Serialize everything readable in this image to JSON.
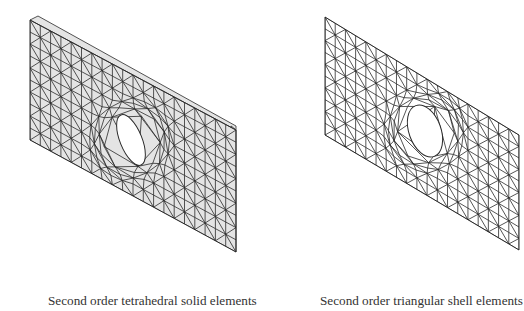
{
  "figures": [
    {
      "id": "left",
      "caption": "Second order tetrahedral solid elements",
      "type": "solid",
      "fill": "#e4e4e4",
      "line_color": "#2a2a2a",
      "outline": {
        "tl": [
          30,
          20
        ],
        "bl": [
          30,
          140
        ],
        "br": [
          236,
          252
        ],
        "tr": [
          236,
          130
        ]
      },
      "thickness": [
        8,
        -4
      ],
      "hole": {
        "cx": 131,
        "cy": 140,
        "rx": 11,
        "ry": 27,
        "rot": -22
      },
      "grid": {
        "cols": 20,
        "rows": 10
      }
    },
    {
      "id": "right",
      "caption": "Second order triangular shell elements",
      "type": "shell",
      "fill": "#ffffff",
      "line_color": "#2a2a2a",
      "outline": {
        "tl": [
          63,
          17
        ],
        "bl": [
          63,
          135
        ],
        "br": [
          257,
          250
        ],
        "tr": [
          257,
          135
        ]
      },
      "thickness": [
        0,
        0
      ],
      "hole": {
        "cx": 163,
        "cy": 131,
        "rx": 16,
        "ry": 27,
        "rot": -20
      },
      "grid": {
        "cols": 19,
        "rows": 10
      }
    }
  ]
}
